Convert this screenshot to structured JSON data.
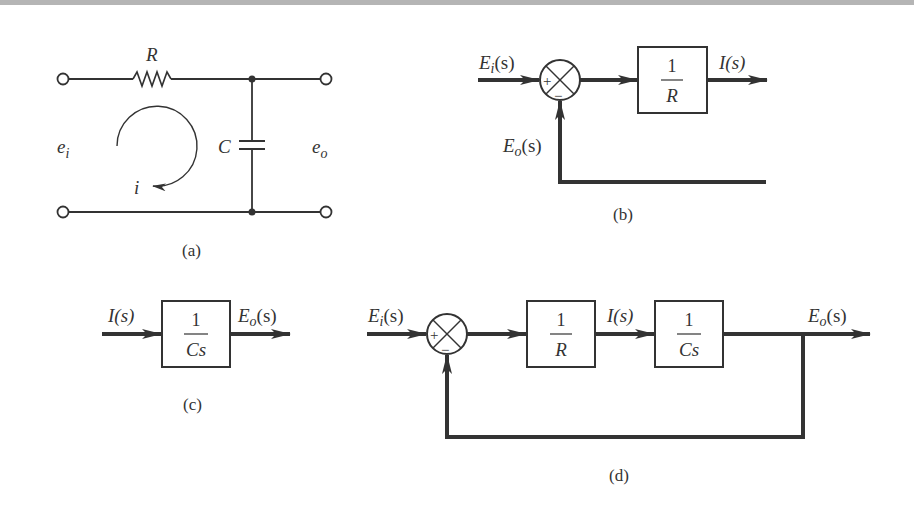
{
  "figure": {
    "panels": [
      {
        "id": "a",
        "caption": "(a)",
        "type": "circuit",
        "labels": {
          "resistor": "R",
          "capacitor": "C",
          "input_voltage": "e",
          "input_sub": "i",
          "output_voltage": "e",
          "output_sub": "o",
          "current": "i"
        }
      },
      {
        "id": "b",
        "caption": "(b)",
        "type": "block-diagram",
        "input": {
          "main": "E",
          "sub": "i",
          "arg": "(s)"
        },
        "feedback": {
          "main": "E",
          "sub": "o",
          "arg": "(s)"
        },
        "summer_signs": {
          "plus": "+",
          "minus": "−"
        },
        "block": {
          "num": "1",
          "den": "R"
        },
        "output": "I(s)"
      },
      {
        "id": "c",
        "caption": "(c)",
        "type": "block-diagram",
        "input": "I(s)",
        "block": {
          "num": "1",
          "den": "Cs"
        },
        "output": {
          "main": "E",
          "sub": "o",
          "arg": "(s)"
        }
      },
      {
        "id": "d",
        "caption": "(d)",
        "type": "block-diagram",
        "input": {
          "main": "E",
          "sub": "i",
          "arg": "(s)"
        },
        "summer_signs": {
          "plus": "+",
          "minus": "−"
        },
        "block1": {
          "num": "1",
          "den": "R"
        },
        "intermediate": "I(s)",
        "block2": {
          "num": "1",
          "den": "Cs"
        },
        "output": {
          "main": "E",
          "sub": "o",
          "arg": "(s)"
        }
      }
    ]
  },
  "colors": {
    "line": "#333333",
    "background": "#ffffff",
    "topbar": "#b5b5b5"
  }
}
